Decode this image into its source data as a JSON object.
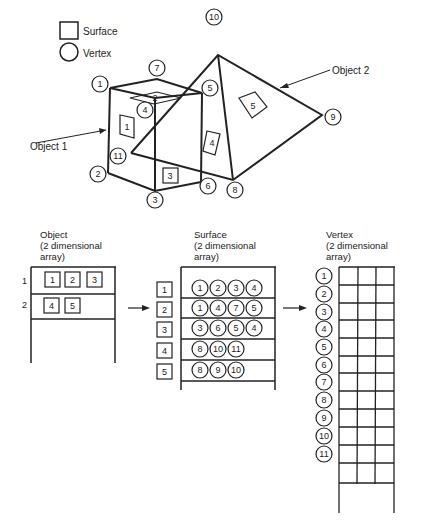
{
  "legend": {
    "surface_label": "Surface",
    "vertex_label": "Vertex"
  },
  "scene": {
    "object1_label": "Object 1",
    "object2_label": "Object 2",
    "vertices": [
      "1",
      "2",
      "3",
      "4",
      "5",
      "6",
      "7",
      "8",
      "9",
      "10",
      "11"
    ],
    "surfaces": [
      "1",
      "2",
      "3",
      "4",
      "5"
    ]
  },
  "object_array": {
    "title_line1": "Object",
    "title_line2": "(2 dimensional",
    "title_line3": "array)",
    "rows": [
      {
        "index": "1",
        "surfaces": [
          "1",
          "2",
          "3"
        ]
      },
      {
        "index": "2",
        "surfaces": [
          "4",
          "5"
        ]
      }
    ]
  },
  "surface_array": {
    "title_line1": "Surface",
    "title_line2": "(2 dimensional",
    "title_line3": "array)",
    "rows": [
      {
        "index": "1",
        "vertices": [
          "1",
          "2",
          "3",
          "4"
        ]
      },
      {
        "index": "2",
        "vertices": [
          "1",
          "4",
          "7",
          "5"
        ]
      },
      {
        "index": "3",
        "vertices": [
          "3",
          "6",
          "5",
          "4"
        ]
      },
      {
        "index": "4",
        "vertices": [
          "8",
          "10",
          "11"
        ]
      },
      {
        "index": "5",
        "vertices": [
          "8",
          "9",
          "10"
        ]
      }
    ]
  },
  "vertex_array": {
    "title_line1": "Vertex",
    "title_line2": "(2 dimensional",
    "title_line3": "array)",
    "rows": [
      "1",
      "2",
      "3",
      "4",
      "5",
      "6",
      "7",
      "8",
      "9",
      "10",
      "11"
    ]
  }
}
